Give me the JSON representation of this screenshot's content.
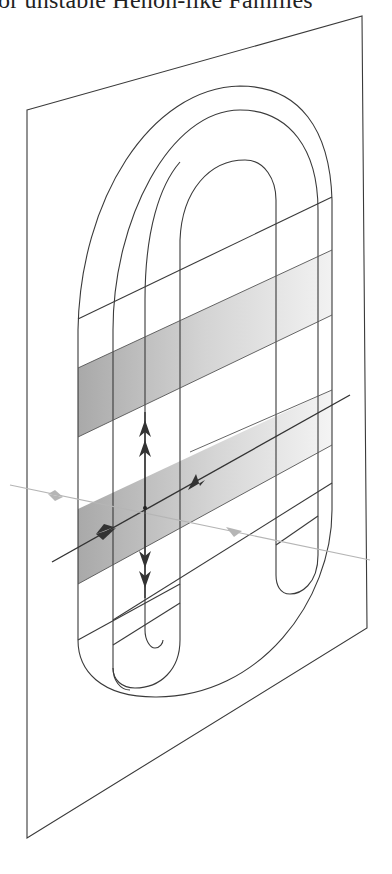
{
  "header": {
    "title_fragment": "or unstable Henon-like Families"
  },
  "figure": {
    "colors": {
      "stroke": "#3a3a3a",
      "band_dark": "#b0b0b0",
      "band_light": "#e6e6e6",
      "transverse_line": "#b5b5b5",
      "arrow": "#333333"
    }
  }
}
